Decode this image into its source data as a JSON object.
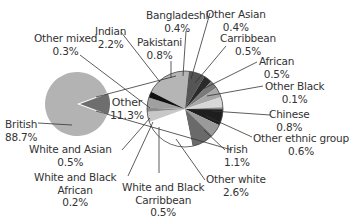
{
  "chart_data": {
    "type": "pie",
    "title": "",
    "main_pie": {
      "slices": [
        {
          "label": "British",
          "value": 88.7,
          "color": "#b3b3b3"
        },
        {
          "label": "Other",
          "value": 11.3,
          "color": "#6e6e6e"
        }
      ]
    },
    "breakdown_pie": {
      "of": "Other",
      "slices": [
        {
          "label": "Indian",
          "value": 2.2,
          "color": "#b5b5b5"
        },
        {
          "label": "Pakistani",
          "value": 0.8,
          "color": "#555555"
        },
        {
          "label": "Bangladeshi",
          "value": 0.4,
          "color": "#2a2a2a"
        },
        {
          "label": "Other Asian",
          "value": 0.4,
          "color": "#7a7a7a"
        },
        {
          "label": "Carribbean",
          "value": 0.5,
          "color": "#a8a8a8"
        },
        {
          "label": "African",
          "value": 0.5,
          "color": "#d8d8d8"
        },
        {
          "label": "Other Black",
          "value": 0.1,
          "color": "#8a8a8a"
        },
        {
          "label": "Chinese",
          "value": 0.8,
          "color": "#1e1e1e"
        },
        {
          "label": "Other ethnic group",
          "value": 0.6,
          "color": "#9a9a9a"
        },
        {
          "label": "Irish",
          "value": 1.1,
          "color": "#6a6a6a"
        },
        {
          "label": "Other white",
          "value": 2.6,
          "color": "#ffffff"
        },
        {
          "label": "White and Black Carribbean",
          "value": 0.5,
          "color": "#c8c8c8"
        },
        {
          "label": "White and Black African",
          "value": 0.2,
          "color": "#8c8c8c"
        },
        {
          "label": "White and Asian",
          "value": 0.5,
          "color": "#a0a0a0"
        },
        {
          "label": "Other mixed",
          "value": 0.3,
          "color": "#111111"
        }
      ]
    },
    "labels": {
      "british": {
        "name": "British",
        "value": "88.7%"
      },
      "other": {
        "name": "Other",
        "value": "11.3%"
      },
      "indian": {
        "name": "Indian",
        "value": "2.2%"
      },
      "pakistani": {
        "name": "Pakistani",
        "value": "0.8%"
      },
      "bangladeshi": {
        "name": "Bangladeshi",
        "value": "0.4%"
      },
      "other_asian": {
        "name": "Other Asian",
        "value": "0.4%"
      },
      "carribbean": {
        "name": "Carribbean",
        "value": "0.5%"
      },
      "african": {
        "name": "African",
        "value": "0.5%"
      },
      "other_black": {
        "name": "Other Black",
        "value": "0.1%"
      },
      "chinese": {
        "name": "Chinese",
        "value": "0.8%"
      },
      "other_ethnic": {
        "name": "Other ethnic group",
        "value": "0.6%"
      },
      "irish": {
        "name": "Irish",
        "value": "1.1%"
      },
      "other_white": {
        "name": "Other white",
        "value": "2.6%"
      },
      "wbc": {
        "name1": "White and Black",
        "name2": "Carribbean",
        "value": "0.5%"
      },
      "wba": {
        "name1": "White and Black",
        "name2": "African",
        "value": "0.2%"
      },
      "wa": {
        "name": "White and Asian",
        "value": "0.5%"
      },
      "other_mixed": {
        "name": "Other mixed",
        "value": "0.3%"
      }
    },
    "legend": "none (callout labels)",
    "grid": false
  }
}
